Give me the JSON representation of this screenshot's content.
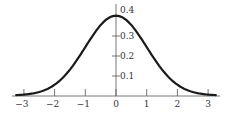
{
  "chart_data": {
    "type": "line",
    "title": "",
    "xlabel": "",
    "ylabel": "",
    "series": [
      {
        "name": "standard normal density",
        "x": [
          -3.2,
          -3,
          -2.5,
          -2,
          -1.5,
          -1,
          -0.5,
          0,
          0.5,
          1,
          1.5,
          2,
          2.5,
          3,
          3.2
        ],
        "values": [
          0.0024,
          0.0044,
          0.0175,
          0.054,
          0.1295,
          0.242,
          0.3521,
          0.3989,
          0.3521,
          0.242,
          0.1295,
          0.054,
          0.0175,
          0.0044,
          0.0024
        ]
      }
    ],
    "x_ticks": [
      "-3",
      "-2",
      "-1",
      "0",
      "1",
      "2",
      "3"
    ],
    "y_ticks": [
      "0.1",
      "0.2",
      "0.3",
      "0.4"
    ],
    "xlim": [
      -3.3,
      3.4
    ],
    "ylim": [
      0,
      0.42
    ],
    "grid": false,
    "legend": "none",
    "colors": {
      "curve": "#1a1a1a",
      "axis": "#555555",
      "text": "#333333"
    }
  }
}
